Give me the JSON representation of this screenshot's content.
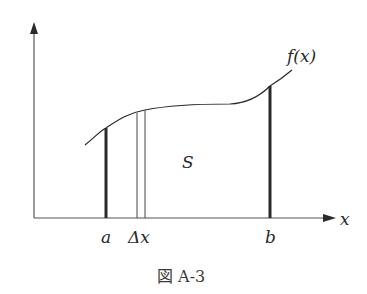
{
  "figure": {
    "caption": "図 A-3",
    "function_label": "f(x)",
    "area_label": "S",
    "x_axis_label": "x",
    "lower_bound_label": "a",
    "delta_label": "Δx",
    "upper_bound_label": "b"
  },
  "colors": {
    "stroke": "#2a2a2a",
    "background": "#ffffff"
  }
}
